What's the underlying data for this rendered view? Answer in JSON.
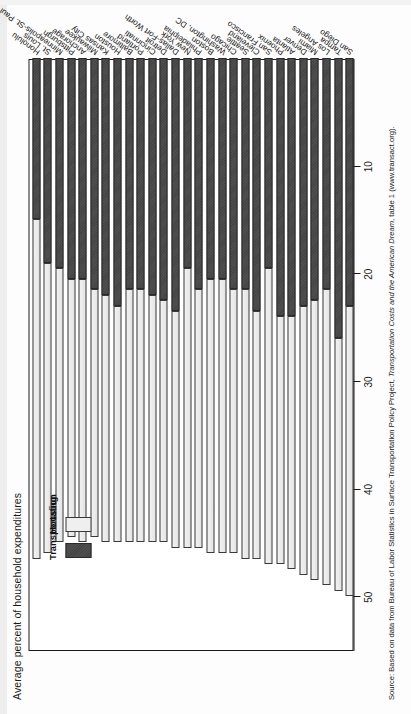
{
  "figure": {
    "axis_title": "Average percent of household expenditures",
    "source_prefix": "Source: Based on data from Bureau of Labor Statistics in Surface Transportation Policy Project, ",
    "source_italic": "Transportation Costs and the American Dream",
    "source_suffix": ", table 1 (www.transact.org)."
  },
  "legend": {
    "transport_label": "Transportation",
    "housing_label": "Housing"
  },
  "chart_data": {
    "type": "bar",
    "orientation": "horizontal-stacked",
    "title": "",
    "xlabel": "Average percent of household expenditures",
    "ylabel": "",
    "xlim": [
      0,
      55
    ],
    "ticks": [
      50,
      40,
      30,
      20,
      10
    ],
    "grid": false,
    "legend_position": "top-left-inside",
    "colors": {
      "housing": "#ebebeb",
      "transportation": "#4a4a4a",
      "axis": "#1a1a1a",
      "text": "#141414"
    },
    "categories": [
      "Honolulu",
      "St. Louis",
      "Minneapolis-St. Paul",
      "Pittsburgh",
      "Anchorage",
      "Milwaukee",
      "Kansas City",
      "Houston",
      "Baltimore",
      "Portland",
      "Cincinnati",
      "Detroit",
      "Dallas-Fort Worth",
      "New York",
      "Philadelphia",
      "Boston",
      "Washington, DC",
      "Chicago",
      "Seattle",
      "Cleveland",
      "San Francisco",
      "Phoenix",
      "Atlanta",
      "Denver",
      "Miami",
      "Los Angeles",
      "Tampa",
      "San Diego"
    ],
    "series": [
      {
        "name": "Housing",
        "key": "housing",
        "values": [
          31.5,
          27.0,
          25.5,
          24.0,
          24.5,
          23.0,
          23.0,
          22.0,
          23.5,
          23.5,
          23.0,
          22.5,
          22.0,
          26.0,
          24.0,
          25.5,
          25.5,
          24.5,
          25.0,
          23.0,
          27.5,
          23.0,
          23.5,
          25.0,
          26.0,
          27.5,
          23.5,
          27.0
        ]
      },
      {
        "name": "Transportation",
        "key": "transportation",
        "values": [
          15.0,
          19.0,
          19.5,
          20.5,
          20.5,
          21.5,
          22.0,
          23.0,
          21.5,
          21.5,
          22.0,
          22.5,
          23.5,
          19.5,
          21.5,
          20.5,
          20.5,
          21.5,
          21.5,
          23.5,
          19.5,
          24.0,
          24.0,
          23.0,
          22.5,
          21.5,
          26.0,
          23.0
        ]
      }
    ],
    "totals": [
      46.5,
      46.0,
      45.0,
      44.5,
      45.0,
      44.5,
      45.0,
      45.0,
      45.0,
      45.0,
      45.0,
      45.0,
      45.5,
      45.5,
      45.5,
      46.0,
      46.0,
      46.0,
      46.5,
      46.5,
      47.0,
      47.0,
      47.5,
      48.0,
      48.5,
      49.0,
      49.5,
      50.0
    ]
  }
}
